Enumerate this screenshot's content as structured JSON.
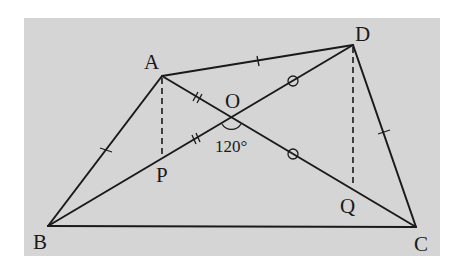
{
  "figure": {
    "background_color": "#d5d5d5",
    "line_color": "#1a1a1a",
    "points": {
      "A": {
        "label": "A",
        "x": 162,
        "y": 76
      },
      "B": {
        "label": "B",
        "x": 48,
        "y": 226
      },
      "C": {
        "label": "C",
        "x": 416,
        "y": 227
      },
      "D": {
        "label": "D",
        "x": 353,
        "y": 45
      },
      "O": {
        "label": "O",
        "x": 231,
        "y": 118
      },
      "P": {
        "label": "P",
        "x": 162,
        "y": 156
      },
      "Q": {
        "label": "Q",
        "x": 353,
        "y": 186
      }
    },
    "angle_label": "120°",
    "segments": [
      {
        "from": "A",
        "to": "B",
        "style": "solid",
        "mark": "single-tick"
      },
      {
        "from": "A",
        "to": "D",
        "style": "solid",
        "mark": "single-tick"
      },
      {
        "from": "D",
        "to": "C",
        "style": "solid",
        "mark": "single-tick"
      },
      {
        "from": "B",
        "to": "C",
        "style": "solid",
        "mark": "none"
      },
      {
        "from": "A",
        "to": "O",
        "style": "solid",
        "mark": "double-tick"
      },
      {
        "from": "B",
        "to": "O",
        "style": "solid",
        "mark": "double-tick"
      },
      {
        "from": "O",
        "to": "D",
        "style": "solid",
        "mark": "circle"
      },
      {
        "from": "O",
        "to": "C",
        "style": "solid",
        "mark": "circle"
      },
      {
        "from": "A",
        "to": "P",
        "style": "dashed",
        "mark": "none"
      },
      {
        "from": "D",
        "to": "Q",
        "style": "dashed",
        "mark": "none"
      }
    ]
  }
}
